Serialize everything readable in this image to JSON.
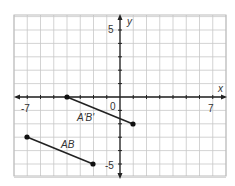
{
  "chart_data": {
    "type": "scatter",
    "title": "",
    "xlabel": "x",
    "ylabel": "y",
    "xlim": [
      -8,
      8
    ],
    "ylim": [
      -6,
      6
    ],
    "grid": true,
    "tick_labels": {
      "x": [
        "-7",
        "0",
        "7"
      ],
      "y": [
        "5",
        "-5"
      ]
    },
    "series": [
      {
        "name": "AB",
        "points": [
          [
            -7,
            -3
          ],
          [
            -2,
            -5
          ]
        ]
      },
      {
        "name": "A'B'",
        "points": [
          [
            -4,
            0
          ],
          [
            1,
            -2
          ]
        ]
      }
    ]
  },
  "labels": {
    "x_axis": "x",
    "y_axis": "y",
    "x_min": "-7",
    "x_max": "7",
    "origin": "0",
    "y_max": "5",
    "y_min": "-5",
    "segment_ab": "AB",
    "segment_ab_prime": "A'B'"
  }
}
